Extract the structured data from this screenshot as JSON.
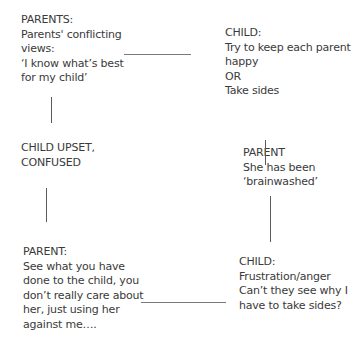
{
  "nodes": {
    "parents_views": {
      "lines": [
        "PARENTS:",
        "Parents' conflicting",
        "views:",
        "‘I know what’s best",
        "for my child’"
      ]
    },
    "child_choice": {
      "lines": [
        "CHILD:",
        "Try to keep each parent",
        "happy",
        "OR",
        "Take sides"
      ]
    },
    "child_upset": {
      "lines": [
        "CHILD UPSET,",
        "CONFUSED"
      ]
    },
    "parent_brainwashed": {
      "lines": [
        "PARENT",
        "She has been",
        "‘brainwashed’"
      ]
    },
    "parent_accuses": {
      "lines": [
        "PARENT:",
        "See what you have",
        "done to the child, you",
        "don’t really care about",
        "her, just using her",
        "against  me…."
      ]
    },
    "child_frustration": {
      "lines": [
        "CHILD:",
        "Frustration/anger",
        "Can’t they see why I",
        "have to take sides?"
      ]
    }
  },
  "colors": {
    "text": "#3a3a3a",
    "connector": "#6a6a6a",
    "background": "#ffffff"
  }
}
